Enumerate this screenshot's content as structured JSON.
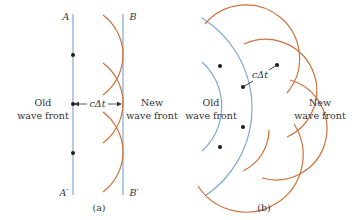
{
  "colors": {
    "wavefront_blue": "#7fa8d6",
    "wavelet_orange": "#d0703a",
    "dot": "#1a1a1a",
    "text": "#333333"
  },
  "panel_a": {
    "caption": "(a)",
    "label_top_left": "A",
    "label_top_right": "B",
    "label_bottom_left": "A′",
    "label_bottom_right": "B′",
    "old_front_line1": "Old",
    "old_front_line2": "wave front",
    "new_front_line1": "New",
    "new_front_line2": "wave front",
    "distance_label": "cΔt"
  },
  "panel_b": {
    "caption": "(b)",
    "old_front_line1": "Old",
    "old_front_line2": "wave front",
    "new_front_line1": "New",
    "new_front_line2": "wave front",
    "distance_label": "cΔt"
  }
}
